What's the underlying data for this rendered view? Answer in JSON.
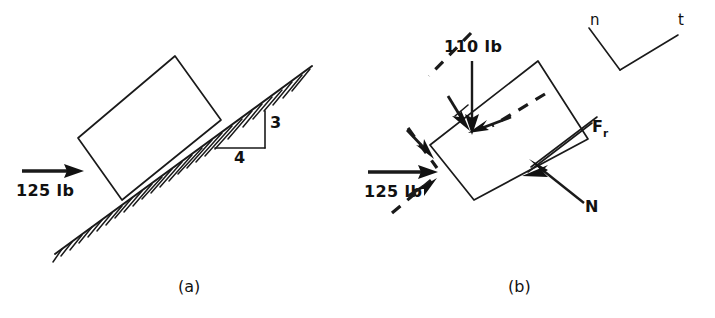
{
  "figure": {
    "background_color": "#ffffff",
    "ink_color": "#111111",
    "panels": [
      {
        "id": "a",
        "caption": "(a)",
        "caption_x": 178,
        "caption_y": 292,
        "description": "Block resting on a hatched incline with applied horizontal force",
        "labels": {
          "applied_force": "125 lb",
          "slope_rise": "3",
          "slope_run": "4"
        },
        "label_positions": {
          "applied_force": {
            "x": 16,
            "y": 195
          },
          "slope_rise": {
            "x": 272,
            "y": 126
          },
          "slope_run": {
            "x": 236,
            "y": 160
          }
        },
        "block_corners": [
          {
            "x": 78,
            "y": 138
          },
          {
            "x": 175,
            "y": 56
          },
          {
            "x": 221,
            "y": 120
          },
          {
            "x": 122,
            "y": 200
          }
        ],
        "incline": {
          "x1": 55,
          "y1": 254,
          "x2": 312,
          "y2": 66
        },
        "slope_triangle": {
          "apex": {
            "x": 251,
            "y": 111
          },
          "corner": {
            "x": 265,
            "y": 148
          },
          "foot": {
            "x": 215,
            "y": 148
          }
        },
        "applied_force_arrow": {
          "x1": 22,
          "y1": 171,
          "x2": 76,
          "y2": 171,
          "direction": "right",
          "magnitude": "125 lb"
        }
      },
      {
        "id": "b",
        "caption": "(b)",
        "caption_x": 508,
        "caption_y": 292,
        "description": "Free-body diagram of the block with applied, weight, friction and normal forces plus n-t axes",
        "labels": {
          "applied_force": "125 lb",
          "weight": "110 lb",
          "friction": "F",
          "friction_subscript": "r",
          "normal": "N",
          "axis_normal": "n",
          "axis_tangential": "t"
        },
        "label_positions": {
          "applied_force": {
            "x": 367,
            "y": 196
          },
          "weight": {
            "x": 446,
            "y": 51
          },
          "friction": {
            "x": 593,
            "y": 130
          },
          "friction_subscript": {
            "x": 604,
            "y": 135
          },
          "normal": {
            "x": 588,
            "y": 211
          },
          "axis_normal": {
            "x": 590,
            "y": 25
          },
          "axis_tangential": {
            "x": 680,
            "y": 25
          }
        },
        "block_corners": [
          {
            "x": 430,
            "y": 145
          },
          {
            "x": 538,
            "y": 61
          },
          {
            "x": 588,
            "y": 139
          },
          {
            "x": 474,
            "y": 200
          }
        ],
        "forces": [
          {
            "name": "applied-force",
            "label": "125 lb",
            "x1": 368,
            "y1": 172,
            "x2": 432,
            "y2": 172
          },
          {
            "name": "weight-force",
            "label": "110 lb",
            "x1": 472,
            "y1": 61,
            "x2": 472,
            "y2": 128
          },
          {
            "name": "friction-force",
            "label": "Fr",
            "x1": 597,
            "y1": 117,
            "x2": 524,
            "y2": 172
          },
          {
            "name": "normal-force",
            "label": "N",
            "x1": 584,
            "y1": 203,
            "x2": 531,
            "y2": 160
          }
        ],
        "axes": {
          "vertex": {
            "x": 620,
            "y": 70
          },
          "n_end": {
            "x": 589,
            "y": 28
          },
          "t_end": {
            "x": 678,
            "y": 35
          }
        }
      }
    ]
  }
}
